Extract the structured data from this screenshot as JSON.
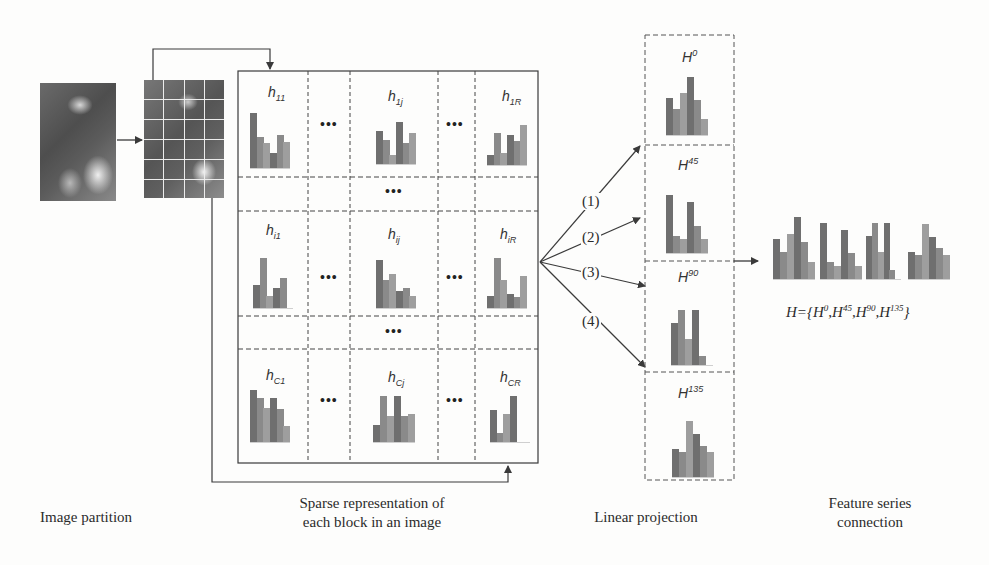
{
  "colors": {
    "line": "#3a3a3a",
    "bar_dark": "#6f6f6f",
    "bar_mid": "#8a8a8a",
    "bar_light": "#9e9e9e",
    "background": "#fdfdfc"
  },
  "stages": {
    "partition": {
      "label": "Image partition"
    },
    "sparse": {
      "label_line1": "Sparse representation of",
      "label_line2": "each block in an image"
    },
    "projection": {
      "label": "Linear projection"
    },
    "connection": {
      "label_line1": "Feature series",
      "label_line2": "connection"
    }
  },
  "block_grid": {
    "rows": [
      {
        "cells": [
          {
            "label": "h",
            "sub": "11"
          },
          {
            "label": "h",
            "sub": "1j"
          },
          {
            "label": "h",
            "sub": "1R"
          }
        ]
      },
      {
        "cells": [
          {
            "label": "h",
            "sub": "i1"
          },
          {
            "label": "h",
            "sub": "ij"
          },
          {
            "label": "h",
            "sub": "iR"
          }
        ]
      },
      {
        "cells": [
          {
            "label": "h",
            "sub": "C1"
          },
          {
            "label": "h",
            "sub": "Cj"
          },
          {
            "label": "h",
            "sub": "CR"
          }
        ]
      }
    ],
    "ellipsis": "•••"
  },
  "projections": {
    "arrows": [
      "(1)",
      "(2)",
      "(3)",
      "(4)"
    ],
    "boxes": [
      {
        "label": "H",
        "sup": "0"
      },
      {
        "label": "H",
        "sup": "45"
      },
      {
        "label": "H",
        "sup": "90"
      },
      {
        "label": "H",
        "sup": "135"
      }
    ]
  },
  "formula": {
    "prefix": "H={",
    "terms": [
      {
        "base": "H",
        "sup": "0"
      },
      {
        "base": "H",
        "sup": "45"
      },
      {
        "base": "H",
        "sup": "90"
      },
      {
        "base": "H",
        "sup": "135"
      }
    ],
    "suffix": "}"
  },
  "histograms": {
    "h11": [
      100,
      56,
      45,
      27,
      60,
      48
    ],
    "h1j": [
      72,
      52,
      20,
      92,
      46,
      68
    ],
    "h1R": [
      22,
      72,
      26,
      66,
      54,
      88
    ],
    "hi1": [
      46,
      100,
      24,
      40,
      60,
      0
    ],
    "hij": [
      100,
      58,
      70,
      36,
      42,
      24
    ],
    "hiR": [
      24,
      100,
      56,
      28,
      22,
      64
    ],
    "hC1": [
      100,
      84,
      66,
      84,
      64,
      30
    ],
    "hCj": [
      36,
      100,
      56,
      100,
      56,
      60
    ],
    "hCR": [
      70,
      20,
      60,
      100,
      0,
      0
    ],
    "H0": [
      64,
      44,
      72,
      100,
      60,
      28
    ],
    "H45": [
      100,
      30,
      24,
      88,
      46,
      24
    ],
    "H90": [
      76,
      100,
      48,
      100,
      16,
      0
    ],
    "H135": [
      50,
      44,
      100,
      76,
      56,
      44
    ]
  }
}
